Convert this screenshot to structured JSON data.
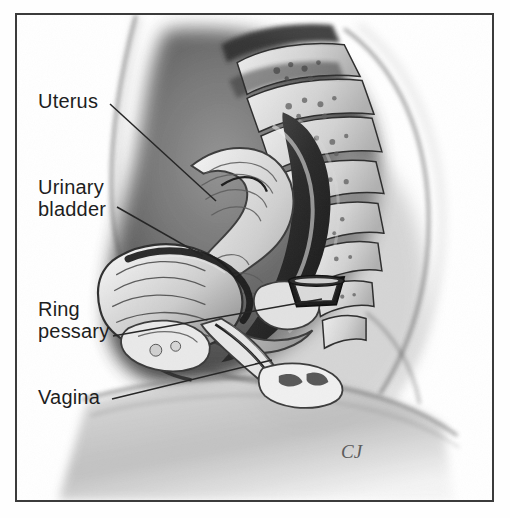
{
  "figure": {
    "kind": "anatomical-illustration",
    "frame_color": "#3b3b3b",
    "background_color": "#ffffff",
    "ink_color": "#1e1e1e"
  },
  "labels": [
    {
      "id": "uterus",
      "text": "Uterus",
      "line1": "Uterus",
      "line2": "",
      "leader": {
        "x1": 110,
        "y1": 104,
        "x2": 216,
        "y2": 201
      }
    },
    {
      "id": "urinary-bladder",
      "text": "Urinary bladder",
      "line1": "Urinary",
      "line2": "bladder",
      "leader": {
        "x1": 117,
        "y1": 207,
        "x2": 203,
        "y2": 256
      }
    },
    {
      "id": "ring-pessary",
      "text": "Ring pessary",
      "line1": "Ring",
      "line2": "pessary",
      "leader": {
        "x1": 113,
        "y1": 336,
        "x2": 322,
        "y2": 299
      }
    },
    {
      "id": "vagina",
      "text": "Vagina",
      "line1": "Vagina",
      "line2": "",
      "leader": {
        "x1": 112,
        "y1": 399,
        "x2": 272,
        "y2": 360
      }
    }
  ],
  "signature": {
    "mark": "CJ"
  }
}
